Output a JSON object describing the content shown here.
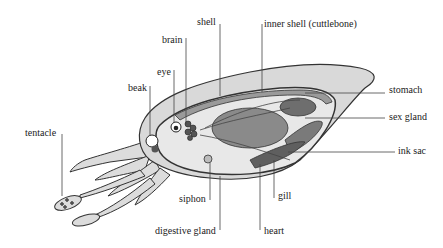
{
  "diagram": {
    "colors": {
      "body_fill": "#d9d9d9",
      "body_outline": "#333333",
      "organ_dark": "#6e6e6e",
      "organ_mid": "#8c8c8c",
      "leader_line": "#444444",
      "background": "#ffffff"
    },
    "labels": {
      "shell": "shell",
      "inner_shell": "inner shell (cuttlebone)",
      "brain": "brain",
      "eye": "eye",
      "beak": "beak",
      "stomach": "stomach",
      "sex_gland": "sex gland",
      "ink_sac": "ink sac",
      "tentacle": "tentacle",
      "siphon": "siphon",
      "gill": "gill",
      "digestive_gland": "digestive gland",
      "heart": "heart"
    }
  }
}
